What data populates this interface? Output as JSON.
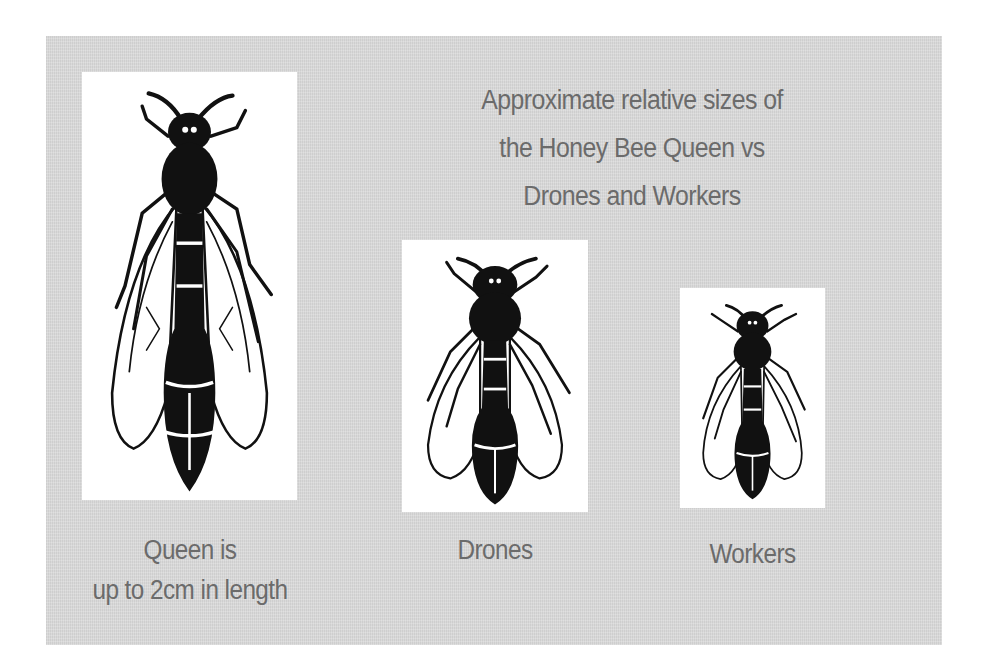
{
  "title": {
    "lines": [
      "Approximate relative sizes of",
      "the Honey Bee Queen vs",
      "Drones and Workers"
    ]
  },
  "bees": [
    {
      "id": "queen",
      "label_lines": [
        "Queen is",
        "up to 2cm in length"
      ]
    },
    {
      "id": "drones",
      "label_lines": [
        "Drones"
      ]
    },
    {
      "id": "workers",
      "label_lines": [
        "Workers"
      ]
    }
  ],
  "colors": {
    "panel_background": "#d9d9d9",
    "box_background": "#ffffff",
    "text": "#6b6b6b",
    "bee_ink": "#111111"
  }
}
